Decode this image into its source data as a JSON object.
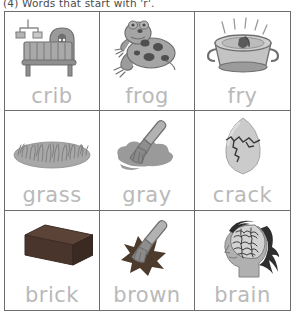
{
  "worksheet": {
    "heading": "(4) Words that start with 'r'.",
    "word_color": "#b9b9b9",
    "border_color": "#6d6d6d",
    "background": "#ffffff",
    "columns": 3,
    "rows": 3
  },
  "cells": [
    {
      "word": "crib",
      "icon": "crib-icon",
      "alt": "baby crib with hanging mobile"
    },
    {
      "word": "frog",
      "icon": "frog-icon",
      "alt": "spotted frog"
    },
    {
      "word": "fry",
      "icon": "frying-pan-icon",
      "alt": "frying pan with steam"
    },
    {
      "word": "grass",
      "icon": "grass-icon",
      "alt": "patch of grass"
    },
    {
      "word": "gray",
      "icon": "gray-paint-icon",
      "alt": "paintbrush with gray paint splotch"
    },
    {
      "word": "crack",
      "icon": "cracked-egg-icon",
      "alt": "egg with a crack"
    },
    {
      "word": "brick",
      "icon": "brick-icon",
      "alt": "dark brown brick"
    },
    {
      "word": "brown",
      "icon": "brown-paint-icon",
      "alt": "paintbrush with brown paint splotch"
    },
    {
      "word": "brain",
      "icon": "brain-head-icon",
      "alt": "side profile of head showing brain"
    }
  ]
}
